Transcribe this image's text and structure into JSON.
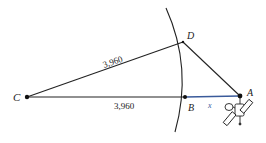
{
  "diagram": {
    "points": {
      "C": {
        "label": "C",
        "x": 27,
        "y": 97
      },
      "D": {
        "label": "D",
        "x": 183,
        "y": 42
      },
      "B": {
        "label": "B",
        "x": 185,
        "y": 97
      },
      "A": {
        "label": "A",
        "x": 240,
        "y": 96
      }
    },
    "segments": {
      "CD": {
        "label": "3,960"
      },
      "CB": {
        "label": "3,960"
      },
      "BA": {
        "label": "x",
        "color": "#3a5a9a"
      }
    },
    "colors": {
      "line": "#222222",
      "highlight": "#3a5a9a"
    },
    "icons": [
      "satellite-icon"
    ]
  }
}
